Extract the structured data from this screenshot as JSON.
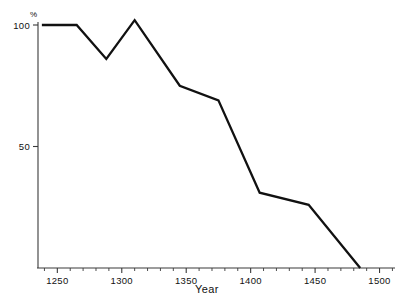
{
  "figure": {
    "cut_off_header": "",
    "background_color": "#ffffff",
    "line_color": "#111111",
    "axis_color": "#3a3a3a"
  },
  "chart_data": {
    "type": "line",
    "title": "",
    "subtitle": "",
    "xlabel": "Year",
    "ylabel": "",
    "y_unit_label": "%",
    "xlim": [
      1235,
      1512
    ],
    "ylim": [
      0,
      110
    ],
    "grid": false,
    "legend": false,
    "legend_position": "none",
    "x_major_ticks": [
      1250,
      1300,
      1350,
      1400,
      1450,
      1500
    ],
    "x_tick_labels": [
      "1250",
      "1300",
      "1350",
      "1400",
      "1450",
      "1500"
    ],
    "x_minor_tick_step": 10,
    "y_major_ticks": [
      50,
      100
    ],
    "y_tick_labels": [
      "50",
      "100"
    ],
    "series": [
      {
        "name": "value",
        "color": "#111111",
        "x": [
          1238,
          1265,
          1288,
          1310,
          1345,
          1375,
          1407,
          1445,
          1485
        ],
        "values": [
          100,
          100,
          86,
          102,
          75,
          69,
          31,
          26,
          0
        ]
      }
    ],
    "annotations": []
  }
}
